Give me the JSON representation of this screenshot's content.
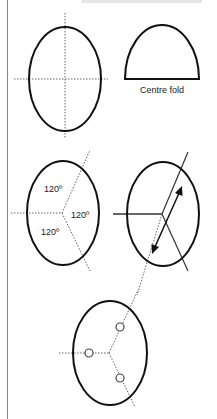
{
  "figure": {
    "panels": [
      {
        "id": "whole-oval",
        "description": "oval with dotted centre cross lines"
      },
      {
        "id": "half-oval",
        "caption": "Centre fold"
      },
      {
        "id": "oval-thirds",
        "angle_labels": [
          "120º",
          "120º",
          "120º"
        ]
      },
      {
        "id": "oval-fold-arrow",
        "description": "oval with solid three-way lines, dotted extension and double-headed arrow"
      },
      {
        "id": "oval-thirds-points",
        "description": "oval with dotted three-way lines and three small circles"
      }
    ]
  },
  "colors": {
    "stroke": "#111111",
    "dotted": "#666666",
    "rule": "#8a8a8a",
    "heading": "#e6e6e6"
  }
}
